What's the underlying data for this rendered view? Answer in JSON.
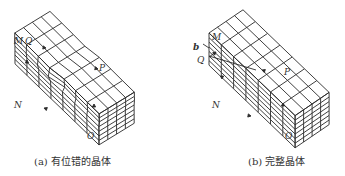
{
  "figure_a": {
    "caption": "(a) 有位错的晶体",
    "labels": {
      "M": "M",
      "Q": "Q",
      "P": "P",
      "N": "N",
      "O": "O"
    }
  },
  "figure_b": {
    "caption": "(b) 完整晶体",
    "labels": {
      "M": "M",
      "Q": "Q",
      "P": "P",
      "N": "N",
      "O": "O",
      "b": "b"
    }
  },
  "colors": {
    "line": "#2a2a2a",
    "text": "#333333",
    "background": "#ffffff"
  }
}
